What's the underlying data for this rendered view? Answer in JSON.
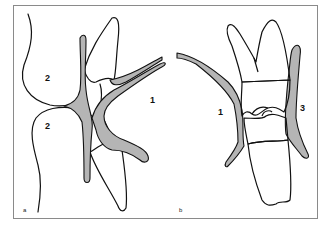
{
  "figure": {
    "panels": [
      {
        "id": "a",
        "panel_label": "a",
        "region_labels": [
          {
            "text": "2",
            "x": 47,
            "y": 78
          },
          {
            "text": "2",
            "x": 47,
            "y": 126
          },
          {
            "text": "1",
            "x": 151,
            "y": 100
          }
        ]
      },
      {
        "id": "b",
        "panel_label": "b",
        "region_labels": [
          {
            "text": "1",
            "x": 219,
            "y": 112
          },
          {
            "text": "3",
            "x": 301,
            "y": 108
          }
        ]
      }
    ],
    "colors": {
      "outline": "#111111",
      "membrane_fill": "#b5b5b5",
      "frame_border": "#8a8a8a",
      "background": "#ffffff"
    }
  }
}
